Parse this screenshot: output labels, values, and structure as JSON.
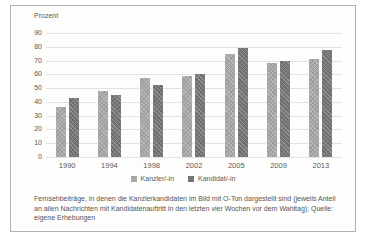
{
  "figure": {
    "background": "#fdfdfc",
    "border_color": "#b2b2b2",
    "text_color": "#595959"
  },
  "chart_data": {
    "type": "bar",
    "title": "",
    "ylabel": "Prozent",
    "xlabel": "",
    "categories": [
      "1990",
      "1994",
      "1998",
      "2002",
      "2005",
      "2009",
      "2013"
    ],
    "series": [
      {
        "name": "Kanzler/-in",
        "color": "#a8a8a8",
        "values": [
          36,
          48,
          57,
          59,
          75,
          68,
          71
        ]
      },
      {
        "name": "Kandidat/-in",
        "color": "#757575",
        "values": [
          43,
          45,
          52,
          60,
          79,
          70,
          78
        ]
      }
    ],
    "ylim": [
      0,
      90
    ],
    "yticks": [
      90,
      80,
      70,
      60,
      50,
      40,
      30,
      20,
      10,
      0
    ],
    "grid": true,
    "gridline_color": "#e3e3e3",
    "legend_position": "bottom"
  },
  "caption": "Fernsehbeiträge, in denen die Kanzlerkandidaten im Bild mit O-Ton dargestellt sind (jeweils Anteil an allen Nachrichten mit Kandidatenauftritt in den letzten vier Wochen vor dem Wahltag); Quelle: eigene Erhebungen"
}
